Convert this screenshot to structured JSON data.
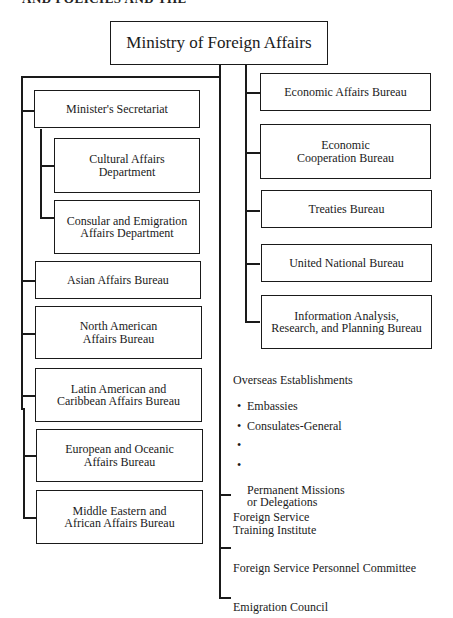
{
  "header_clip": "AND POLICIES AND THE",
  "top": {
    "label": "Ministry of Foreign Affairs"
  },
  "left_column": {
    "secretariat": "Minister's Secretariat",
    "sub_departments": [
      "Cultural Affairs\nDepartment",
      "Consular and Emigration\nAffairs Department"
    ],
    "bureaus": [
      "Asian Affairs Bureau",
      "North American\nAffairs Bureau",
      "Latin American and\nCaribbean Affairs Bureau",
      "European and Oceanic\nAffairs Bureau",
      "Middle Eastern and\nAfrican Affairs Bureau"
    ]
  },
  "right_column": {
    "bureaus": [
      "Economic Affairs Bureau",
      "Economic\nCooperation Bureau",
      "Treaties Bureau",
      "United National Bureau",
      "Information Analysis,\nResearch, and Planning Bureau"
    ]
  },
  "overseas": {
    "title": "Overseas Establishments",
    "items": [
      "Embassies",
      "Consulates-General",
      "",
      "Permanent Missions\nor Delegations"
    ],
    "bullet": "•"
  },
  "other_units": [
    "Foreign Service\nTraining Institute",
    "Foreign Service Personnel Committee",
    "Emigration Council"
  ]
}
